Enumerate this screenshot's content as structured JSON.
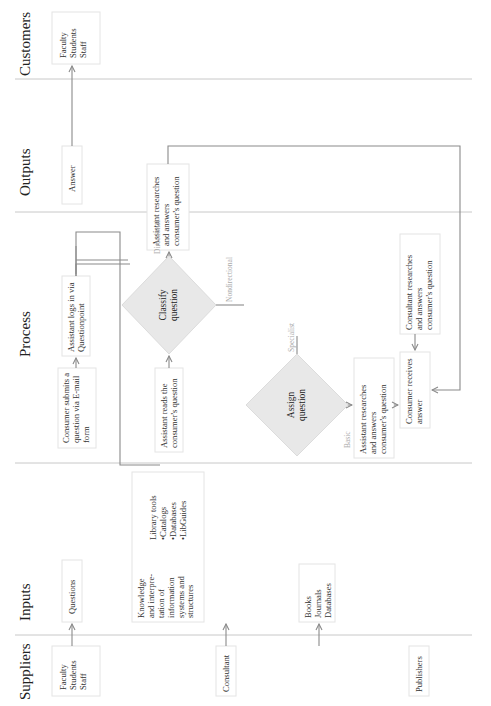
{
  "lanes": [
    {
      "id": "suppliers",
      "title": "Suppliers"
    },
    {
      "id": "inputs",
      "title": "Inputs"
    },
    {
      "id": "process",
      "title": "Process"
    },
    {
      "id": "outputs",
      "title": "Outputs"
    },
    {
      "id": "customers",
      "title": "Customers"
    }
  ],
  "suppliers": {
    "users": [
      "Faculty",
      "Students",
      "Staff"
    ],
    "consultant": [
      "Consultant"
    ],
    "publishers": [
      "Publishers"
    ]
  },
  "inputs": {
    "questions": [
      "Questions"
    ],
    "knowledge": [
      "Knowledge",
      "and interpre-",
      "tation of",
      "information",
      "systems and",
      "structures"
    ],
    "library_tools": [
      "Library tools",
      "•Catalogs",
      "•Databases",
      "•LibGuides"
    ],
    "resources": [
      "Books",
      "Journals",
      "Databases"
    ]
  },
  "process": {
    "submit": [
      "Consumer submits a",
      "question via E-mail",
      "form"
    ],
    "login": [
      "Assistant logs in via",
      "Questionpoint"
    ],
    "read": [
      "Assistant reads the",
      "consumer's question"
    ],
    "classify": [
      "Classify",
      "question"
    ],
    "directional_answer": [
      "Assistant researches",
      "and answers",
      "consumer's question"
    ],
    "assign": [
      "Assign",
      "question"
    ],
    "basic_answer": [
      "Assistant researches",
      "and answers",
      "consumer's question"
    ],
    "consultant_answer": [
      "Consultant researches",
      "and answers",
      "consumer's question"
    ],
    "receives": [
      "Consumer receives",
      "answer"
    ],
    "labels": {
      "directional": "Directional",
      "nondirectional": "Nondirectional",
      "basic": "Basic",
      "specialist": "Specialist"
    }
  },
  "outputs": {
    "answer": [
      "Answer"
    ]
  },
  "customers": {
    "users": [
      "Faculty",
      "Students",
      "Staff"
    ]
  },
  "colors": {
    "connector": "#8a8a8a",
    "diamond_fill": "#e8e8e8",
    "divider": "#c8c8c8",
    "branch_label": "#aaaaaa"
  }
}
